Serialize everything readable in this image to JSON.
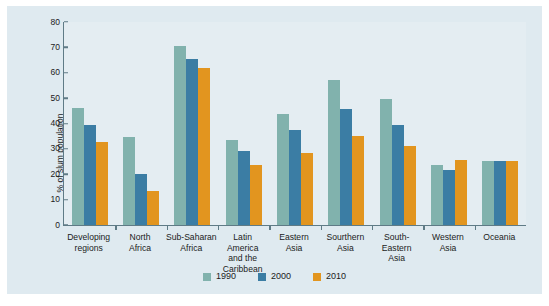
{
  "chart_data": {
    "type": "bar",
    "title": "",
    "xlabel": "",
    "ylabel": "% of slum population",
    "ylim": [
      0,
      80
    ],
    "ytick_step": 10,
    "yticks": [
      "0",
      "10",
      "20",
      "30",
      "40",
      "50",
      "60",
      "70",
      "80"
    ],
    "grid": false,
    "legend_position": "bottom",
    "categories": [
      "Developing\nregions",
      "North\nAfrica",
      "Sub-Saharan\nAfrica",
      "Latin America\nand the\nCaribbean",
      "Eastern\nAsia",
      "Sourthern\nAsia",
      "South-Eastern\nAsia",
      "Western\nAsia",
      "Oceania"
    ],
    "series": [
      {
        "name": "1990",
        "color": "#81b2ad",
        "values": [
          46.2,
          34.5,
          70.5,
          33.7,
          43.7,
          57.2,
          49.5,
          23.5,
          25.3
        ]
      },
      {
        "name": "2000",
        "color": "#3b7da4",
        "values": [
          39.4,
          20.3,
          65.4,
          29.2,
          37.4,
          45.8,
          39.6,
          21.6,
          25.3
        ]
      },
      {
        "name": "2010",
        "color": "#e2951f",
        "values": [
          32.7,
          13.3,
          61.7,
          23.5,
          28.2,
          35.0,
          31.0,
          25.7,
          25.3
        ]
      }
    ]
  },
  "legend": {
    "items": [
      {
        "label": "1990",
        "color": "#81b2ad"
      },
      {
        "label": "2000",
        "color": "#3b7da4"
      },
      {
        "label": "2010",
        "color": "#e2951f"
      }
    ]
  },
  "colors": {
    "series_1990": "#81b2ad",
    "series_2000": "#3b7da4",
    "series_2010": "#e2951f",
    "panel_background": "#dfeaf0",
    "plot_background": "#e4edf2",
    "axis": "#5f7b86",
    "text": "#1b1b1b"
  }
}
